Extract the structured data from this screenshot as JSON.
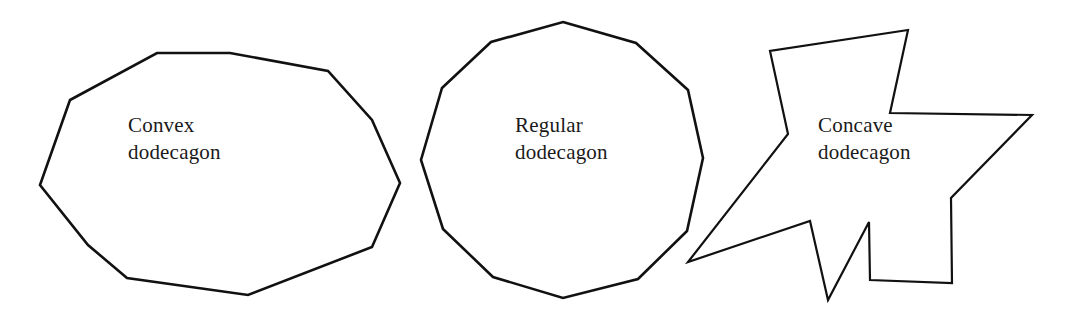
{
  "figure": {
    "background_color": "#ffffff",
    "stroke_color": "#111111",
    "text_color": "#1a1a1a",
    "width": 1065,
    "height": 324
  },
  "shapes": [
    {
      "id": "convex-dodecagon",
      "label_line1": "Convex",
      "label_line2": "dodecagon",
      "sides": 12,
      "kind": "convex",
      "label_x": 128,
      "label_y": 132,
      "stroke_width": 2.6,
      "points": "157,53 230,53 328,71 372,120 400,183 372,247 248,295 127,278 88,245 40,185 70,100 157,53"
    },
    {
      "id": "regular-dodecagon",
      "label_line1": "Regular",
      "label_line2": "dodecagon",
      "sides": 12,
      "kind": "regular",
      "label_x": 515,
      "label_y": 132,
      "stroke_width": 2.6,
      "points": "563,22 636,43 688,90 703,158 687,231 638,279 563,298 493,277 443,229 421,160 442,88 491,42 563,22"
    },
    {
      "id": "concave-dodecagon",
      "label_line1": "Concave",
      "label_line2": "dodecagon",
      "sides": 12,
      "kind": "concave",
      "label_x": 818,
      "label_y": 132,
      "stroke_width": 2.2,
      "points": "908,30 890,113 1032,115 951,198 952,283 870,280 869,222 828,300 810,221 688,262 788,134 770,51 908,30"
    }
  ]
}
